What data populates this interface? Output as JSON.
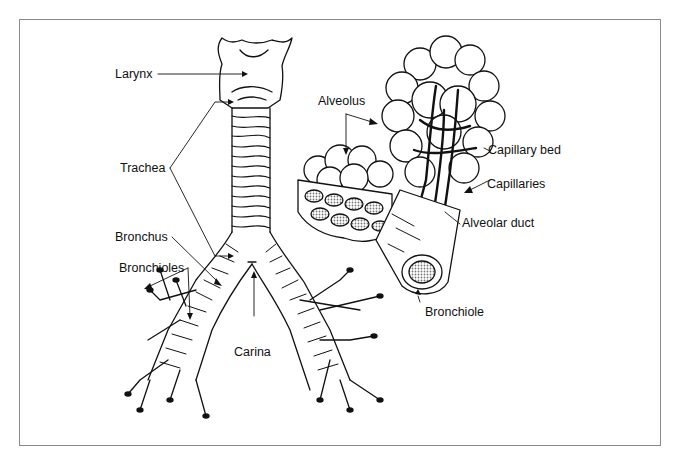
{
  "diagram": {
    "labels": {
      "larynx": "Larynx",
      "trachea": "Trachea",
      "bronchus": "Bronchus",
      "bronchioles": "Bronchioles",
      "carina": "Carina",
      "alveolus": "Alveolus",
      "capillary_bed": "Capillary bed",
      "capillaries": "Capillaries",
      "alveolar_duct": "Alveolar duct",
      "bronchiole": "Bronchiole"
    },
    "colors": {
      "ink": "#111111",
      "frame": "#8a8a8a",
      "background": "#ffffff",
      "shading": "#9a9a9a"
    }
  }
}
